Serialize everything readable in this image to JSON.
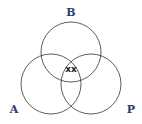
{
  "diagram": {
    "type": "venn",
    "sets": [
      {
        "label": "B",
        "cx": 71,
        "cy": 52,
        "r": 30
      },
      {
        "label": "A",
        "cx": 51,
        "cy": 84,
        "r": 30
      },
      {
        "label": "P",
        "cx": 91,
        "cy": 84,
        "r": 30
      }
    ],
    "labels": {
      "b": "B",
      "a": "A",
      "p": "P"
    },
    "marks": "xx",
    "colors": {
      "label": "#2e3a6e",
      "stroke": "#333333"
    }
  }
}
